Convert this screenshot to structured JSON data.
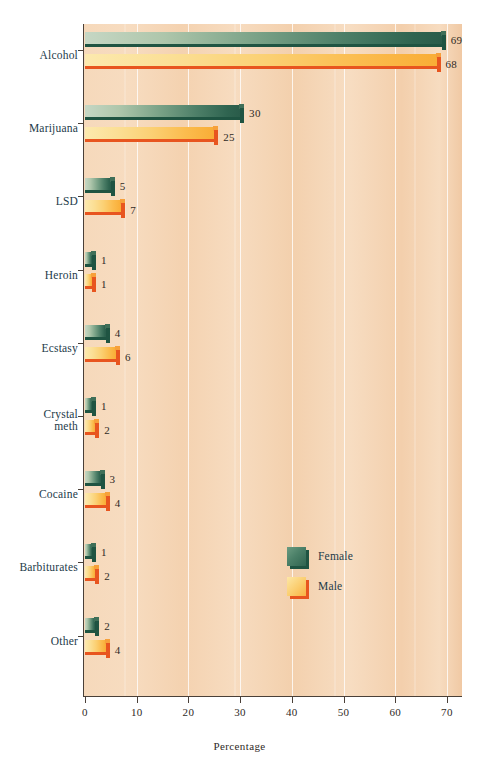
{
  "chart_data": {
    "type": "bar",
    "orientation": "horizontal",
    "title": "",
    "xlabel": "Percentage",
    "ylabel": "",
    "xlim": [
      0,
      72
    ],
    "xticks": [
      0,
      10,
      20,
      30,
      40,
      50,
      60,
      70
    ],
    "xtick_labels": [
      "0",
      "10",
      "20",
      "30",
      "40",
      "50",
      "60",
      "70"
    ],
    "grid": "vertical",
    "legend_position": "inside-center-lower",
    "categories": [
      "Alcohol",
      "Marijuana",
      "LSD",
      "Heroin",
      "Ecstasy",
      "Crystal meth",
      "Cocaine",
      "Barbiturates",
      "Other"
    ],
    "series": [
      {
        "name": "Female",
        "color": "#2f6450",
        "values": [
          69,
          30,
          5,
          1,
          4,
          1,
          3,
          1,
          2
        ]
      },
      {
        "name": "Male",
        "color": "#f9ad36",
        "values": [
          68,
          25,
          7,
          1,
          6,
          2,
          4,
          2,
          4
        ]
      }
    ]
  },
  "axis": {
    "x_title": "Percentage",
    "ticks": [
      {
        "value": 0,
        "label": "0"
      },
      {
        "value": 10,
        "label": "10"
      },
      {
        "value": 20,
        "label": "20"
      },
      {
        "value": 30,
        "label": "30"
      },
      {
        "value": 40,
        "label": "40"
      },
      {
        "value": 50,
        "label": "50"
      },
      {
        "value": 60,
        "label": "60"
      },
      {
        "value": 70,
        "label": "70"
      }
    ]
  },
  "categories": [
    {
      "label": "Alcohol",
      "line1": "Alcohol",
      "line2": ""
    },
    {
      "label": "Marijuana",
      "line1": "Marijuana",
      "line2": ""
    },
    {
      "label": "LSD",
      "line1": "LSD",
      "line2": ""
    },
    {
      "label": "Heroin",
      "line1": "Heroin",
      "line2": ""
    },
    {
      "label": "Ecstasy",
      "line1": "Ecstasy",
      "line2": ""
    },
    {
      "label": "Crystal meth",
      "line1": "Crystal",
      "line2": "meth"
    },
    {
      "label": "Cocaine",
      "line1": "Cocaine",
      "line2": ""
    },
    {
      "label": "Barbiturates",
      "line1": "Barbiturates",
      "line2": ""
    },
    {
      "label": "Other",
      "line1": "Other",
      "line2": ""
    }
  ],
  "bar_values": {
    "alcohol": {
      "female": "69",
      "male": "68"
    },
    "marijuana": {
      "female": "30",
      "male": "25"
    },
    "lsd": {
      "female": "5",
      "male": "7"
    },
    "heroin": {
      "female": "1",
      "male": "1"
    },
    "ecstasy": {
      "female": "4",
      "male": "6"
    },
    "crystal_meth": {
      "female": "1",
      "male": "2"
    },
    "cocaine": {
      "female": "3",
      "male": "4"
    },
    "barbiturates": {
      "female": "1",
      "male": "2"
    },
    "other": {
      "female": "2",
      "male": "4"
    }
  },
  "legend": {
    "items": [
      {
        "label": "Female",
        "color": "#2f6450"
      },
      {
        "label": "Male",
        "color": "#f9ad36"
      }
    ]
  },
  "colors": {
    "plot_background": "#f5d6b8",
    "female_bar": "#2f6450",
    "female_bar_edge": "#1f5442",
    "male_bar": "#f9ad36",
    "male_bar_edge": "#e8551f",
    "axis": "#4a4038",
    "label_text": "#1d3b4a",
    "value_text": "#2f2a26",
    "gridline": "#ffffff"
  }
}
